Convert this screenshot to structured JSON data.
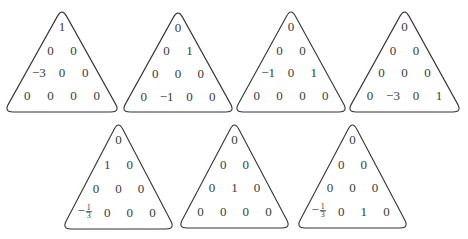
{
  "figure": {
    "triangles": [
      {
        "id": 1,
        "rows": [
          [
            "1"
          ],
          [
            "0",
            "0"
          ],
          [
            "−3",
            "0",
            "0"
          ],
          [
            "0",
            "0",
            "0",
            "0"
          ]
        ]
      },
      {
        "id": 2,
        "rows": [
          [
            "0"
          ],
          [
            "0",
            "1"
          ],
          [
            "0",
            "0",
            "0"
          ],
          [
            "0",
            "−1",
            "0",
            "0"
          ]
        ]
      },
      {
        "id": 3,
        "rows": [
          [
            "0"
          ],
          [
            "0",
            "0"
          ],
          [
            "−1",
            "0",
            "1"
          ],
          [
            "0",
            "0",
            "0",
            "0"
          ]
        ]
      },
      {
        "id": 4,
        "rows": [
          [
            "0"
          ],
          [
            "0",
            "0"
          ],
          [
            "0",
            "0",
            "0"
          ],
          [
            "0",
            "−3",
            "0",
            "1"
          ]
        ]
      },
      {
        "id": 5,
        "rows": [
          [
            "0"
          ],
          [
            "1",
            "0"
          ],
          [
            "0",
            "0",
            "0"
          ],
          [
            "−1/3",
            "0",
            "0",
            "0"
          ]
        ]
      },
      {
        "id": 6,
        "rows": [
          [
            "0"
          ],
          [
            "0",
            "0"
          ],
          [
            "0",
            "1",
            "0"
          ],
          [
            "0",
            "0",
            "0",
            "0"
          ]
        ]
      },
      {
        "id": 7,
        "rows": [
          [
            "0"
          ],
          [
            "0",
            "0"
          ],
          [
            "0",
            "0",
            "0"
          ],
          [
            "−1/3",
            "0",
            "1",
            "0"
          ]
        ]
      }
    ]
  },
  "layout": [
    {
      "x": 4,
      "y": 8,
      "w": 116,
      "h": 104
    },
    {
      "x": 121,
      "y": 9,
      "w": 114,
      "h": 103
    },
    {
      "x": 234,
      "y": 8,
      "w": 114,
      "h": 104
    },
    {
      "x": 347,
      "y": 8,
      "w": 115,
      "h": 104
    },
    {
      "x": 62,
      "y": 121,
      "w": 113,
      "h": 108
    },
    {
      "x": 178,
      "y": 121,
      "w": 113,
      "h": 107
    },
    {
      "x": 296,
      "y": 121,
      "w": 113,
      "h": 107
    }
  ]
}
